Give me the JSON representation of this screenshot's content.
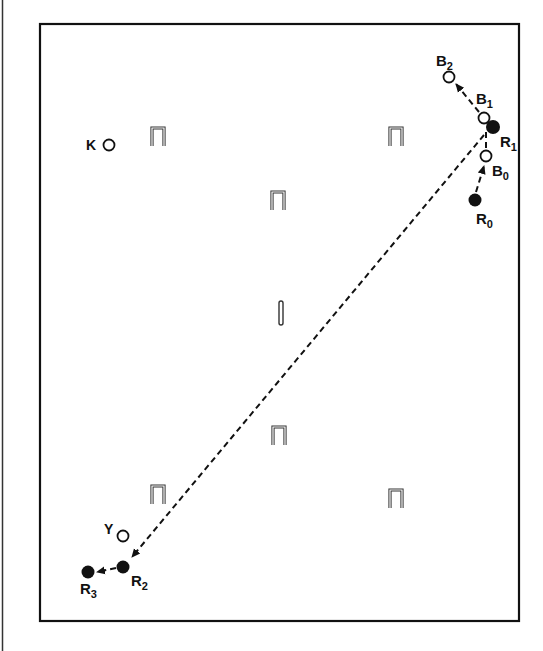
{
  "diagram": {
    "type": "croquet-court-shot-diagram",
    "colors": {
      "ink": "#111111",
      "background": "#ffffff"
    },
    "balls": [
      {
        "id": "K",
        "label": "K",
        "sub": "",
        "fill": "open",
        "x": 109,
        "y": 145
      },
      {
        "id": "Y",
        "label": "Y",
        "sub": "",
        "fill": "open",
        "x": 123,
        "y": 536
      },
      {
        "id": "B0",
        "label": "B",
        "sub": "0",
        "fill": "open",
        "x": 486,
        "y": 156
      },
      {
        "id": "B1",
        "label": "B",
        "sub": "1",
        "fill": "open",
        "x": 484,
        "y": 118
      },
      {
        "id": "B2",
        "label": "B",
        "sub": "2",
        "fill": "open",
        "x": 449,
        "y": 77
      },
      {
        "id": "R0",
        "label": "R",
        "sub": "0",
        "fill": "filled",
        "x": 475,
        "y": 200
      },
      {
        "id": "R1",
        "label": "R",
        "sub": "1",
        "fill": "filled",
        "x": 493,
        "y": 127
      },
      {
        "id": "R2",
        "label": "R",
        "sub": "2",
        "fill": "filled",
        "x": 123,
        "y": 567
      },
      {
        "id": "R3",
        "label": "R",
        "sub": "3",
        "fill": "filled",
        "x": 88,
        "y": 572
      }
    ],
    "labels": {
      "K": "K",
      "Y": "Y",
      "B0": "B",
      "B0_sub": "0",
      "B1": "B",
      "B1_sub": "1",
      "B2": "B",
      "B2_sub": "2",
      "R0": "R",
      "R0_sub": "0",
      "R1": "R",
      "R1_sub": "1",
      "R2": "R",
      "R2_sub": "2",
      "R3": "R",
      "R3_sub": "3"
    },
    "hoops": [
      {
        "name": "hoop-1",
        "x": 158,
        "y": 137
      },
      {
        "name": "hoop-2",
        "x": 396,
        "y": 137
      },
      {
        "name": "hoop-3",
        "x": 278,
        "y": 201
      },
      {
        "name": "hoop-4",
        "x": 279,
        "y": 436
      },
      {
        "name": "hoop-5",
        "x": 158,
        "y": 495
      },
      {
        "name": "hoop-6",
        "x": 396,
        "y": 499
      }
    ],
    "peg": {
      "x": 281,
      "y": 313
    },
    "paths": [
      {
        "name": "R0-to-B0",
        "from": "R0",
        "to": "B0",
        "style": "dashed-arrow"
      },
      {
        "name": "B1-to-B2",
        "from": "B1",
        "to": "B2",
        "style": "dashed-arrow"
      },
      {
        "name": "R1-to-R2",
        "from": "R1",
        "to": "R2",
        "style": "dashed-arrow"
      },
      {
        "name": "R2-to-R3",
        "from": "R2",
        "to": "R3",
        "style": "dashed-arrow"
      }
    ]
  }
}
